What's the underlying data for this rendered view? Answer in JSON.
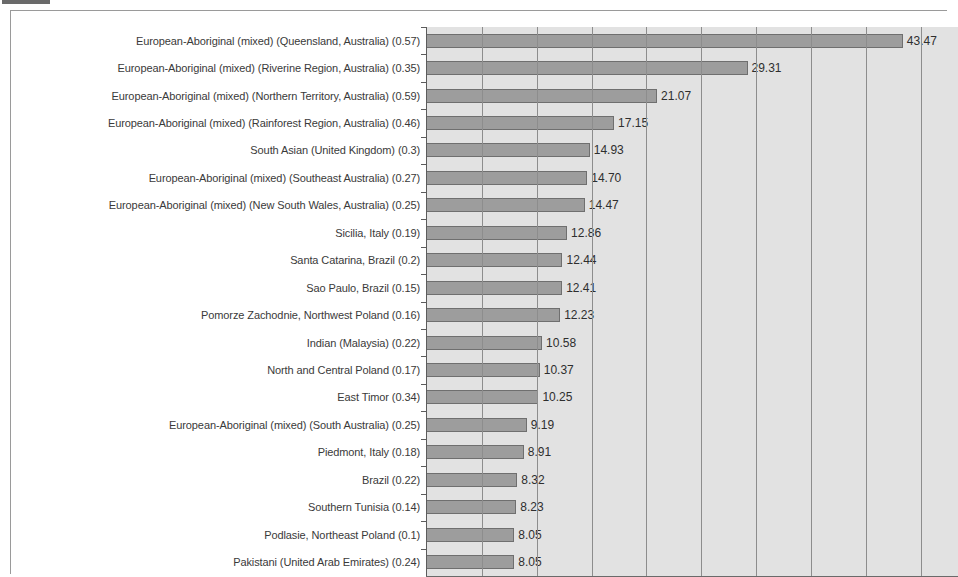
{
  "chart_data": {
    "type": "bar",
    "orientation": "horizontal",
    "title": "",
    "subtitle": "",
    "xlabel": "",
    "ylabel": "",
    "xlim": [
      0,
      48.5
    ],
    "grid": true,
    "grid_interval": 5,
    "legend": "none",
    "value_label_format": "2 decimals",
    "colors": {
      "bar_fill": "#9d9d9d",
      "bar_border": "#6f6f6f",
      "plot_background": "#e2e2e2",
      "page_background": "#ffffff",
      "axis": "#5c5c5c",
      "gridline": "#8d8d8d",
      "label_text": "#3a3a3a",
      "value_text": "#2e2e2e"
    },
    "categories": [
      "European-Aboriginal (mixed) (Queensland, Australia) (0.57)",
      "European-Aboriginal (mixed) (Riverine Region, Australia) (0.35)",
      "European-Aboriginal (mixed) (Northern Territory, Australia) (0.59)",
      "European-Aboriginal (mixed) (Rainforest Region, Australia) (0.46)",
      "South Asian (United Kingdom) (0.3)",
      "European-Aboriginal (mixed) (Southeast Australia) (0.27)",
      "European-Aboriginal (mixed) (New South Wales, Australia) (0.25)",
      "Sicilia, Italy (0.19)",
      "Santa Catarina, Brazil (0.2)",
      "Sao Paulo, Brazil (0.15)",
      "Pomorze Zachodnie, Northwest Poland (0.16)",
      "Indian (Malaysia) (0.22)",
      "North and Central Poland (0.17)",
      "East Timor (0.34)",
      "European-Aboriginal (mixed) (South Australia) (0.25)",
      "Piedmont, Italy (0.18)",
      "Brazil (0.22)",
      "Southern Tunisia (0.14)",
      "Podlasie, Northeast Poland (0.1)",
      "Pakistani (United Arab Emirates) (0.24)"
    ],
    "values": [
      43.47,
      29.31,
      21.07,
      17.15,
      14.93,
      14.7,
      14.47,
      12.86,
      12.44,
      12.41,
      12.23,
      10.58,
      10.37,
      10.25,
      9.19,
      8.91,
      8.32,
      8.23,
      8.05,
      8.05
    ],
    "value_labels": [
      "43.47",
      "29.31",
      "21.07",
      "17.15",
      "14.93",
      "14.70",
      "14.47",
      "12.86",
      "12.44",
      "12.41",
      "12.23",
      "10.58",
      "10.37",
      "10.25",
      "9.19",
      "8.91",
      "8.32",
      "8.23",
      "8.05",
      "8.05"
    ],
    "gridline_values": [
      5,
      10,
      15,
      20,
      25,
      30,
      35,
      40,
      45
    ]
  }
}
